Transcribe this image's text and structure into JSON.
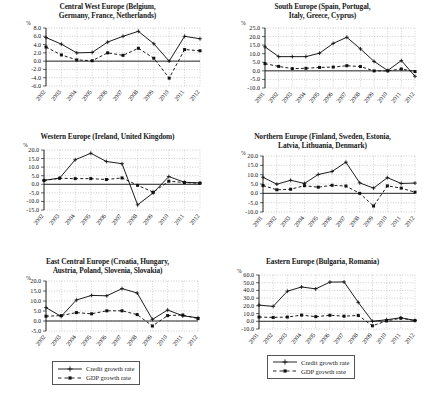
{
  "figure": {
    "units_label": "%",
    "legend": {
      "credit_label": "Credit growth rate",
      "gdp_label": "GDP growth rate",
      "credit_color": "#111111",
      "gdp_color": "#111111"
    }
  },
  "chart_data": [
    {
      "type": "line",
      "id": "central-west-europe",
      "title": "Central West Europe (Belgium, Germany, France, Netherlands)",
      "title_lines": [
        "Central West Europe (Belgium,",
        "Germany, France, Netherlands)"
      ],
      "xlabel": "",
      "ylabel": "%",
      "ylim": [
        -6.0,
        8.0
      ],
      "yticks": [
        8.0,
        6.0,
        4.0,
        2.0,
        0.0,
        -2.0,
        -4.0,
        -6.0
      ],
      "ytick_labels": [
        "8.0",
        "6.0",
        "4.0",
        "2.0",
        "0.0",
        "-2.0",
        "-4.0",
        "-6.0"
      ],
      "grid": true,
      "categories": [
        "2002",
        "2003",
        "2004",
        "2005",
        "2006",
        "2007",
        "2008",
        "2009",
        "2010",
        "2011",
        "2012"
      ],
      "series": [
        {
          "name": "Credit growth rate",
          "values": [
            5.7,
            4.1,
            2.0,
            2.1,
            4.6,
            6.0,
            7.2,
            4.2,
            0.0,
            6.0,
            5.4
          ]
        },
        {
          "name": "GDP growth rate",
          "values": [
            3.4,
            1.5,
            0.3,
            0.1,
            2.0,
            1.4,
            3.1,
            0.7,
            -4.1,
            2.8,
            2.5
          ]
        }
      ],
      "series_extra_last": [
        3.2,
        0.2
      ]
    },
    {
      "type": "line",
      "id": "south-europe",
      "title": "South Europe (Spain, Portugal, Italy, Greece, Cyprus)",
      "title_lines": [
        "South Europe (Spain, Portugal,",
        "Italy, Greece, Cyprus)"
      ],
      "xlabel": "",
      "ylabel": "%",
      "ylim": [
        -10.0,
        25.0
      ],
      "yticks": [
        25.0,
        20.0,
        15.0,
        10.0,
        5.0,
        0.0,
        -5.0,
        -10.0
      ],
      "ytick_labels": [
        "25.0",
        "20.0",
        "15.0",
        "10.0",
        "5.0",
        "0.0",
        "-5.0",
        "-10.0"
      ],
      "grid": true,
      "categories": [
        "2001",
        "2002",
        "2003",
        "2004",
        "2005",
        "2006",
        "2007",
        "2008",
        "2009",
        "2010",
        "2011",
        "2012"
      ],
      "series": [
        {
          "name": "Credit growth rate",
          "values": [
            14.0,
            8.3,
            8.3,
            8.3,
            10.3,
            16.0,
            19.6,
            12.8,
            5.5,
            0.2,
            6.0,
            -3.2
          ]
        },
        {
          "name": "GDP growth rate",
          "values": [
            4.2,
            2.6,
            1.3,
            1.5,
            2.0,
            2.2,
            3.0,
            2.5,
            0.0,
            0.0,
            1.1,
            -0.4
          ]
        }
      ]
    },
    {
      "type": "line",
      "id": "western-europe",
      "title": "Western Europe (Ireland, United Kingdom)",
      "title_lines": [
        "Western Europe (Ireland, United Kingdom)"
      ],
      "xlabel": "",
      "ylabel": "%",
      "ylim": [
        -15.0,
        20.0
      ],
      "yticks": [
        20.0,
        15.0,
        10.0,
        5.0,
        0.0,
        -5.0,
        -10.0,
        -15.0
      ],
      "ytick_labels": [
        "20.0",
        "15.0",
        "10.0",
        "5.0",
        "0.0",
        "-5.0",
        "-10.0",
        "-15.0"
      ],
      "grid": true,
      "categories": [
        "2002",
        "2003",
        "2004",
        "2005",
        "2006",
        "2007",
        "2008",
        "2009",
        "2010",
        "2011",
        "2012"
      ],
      "series": [
        {
          "name": "Credit growth rate",
          "values": [
            2.3,
            3.6,
            14.3,
            18.1,
            13.3,
            12.0,
            -12.0,
            -5.0,
            4.5,
            1.2,
            0.8
          ]
        },
        {
          "name": "GDP growth rate",
          "values": [
            2.2,
            3.5,
            3.3,
            3.3,
            2.8,
            3.7,
            -0.6,
            -4.6,
            1.8,
            1.0,
            0.6
          ]
        }
      ]
    },
    {
      "type": "line",
      "id": "northern-europe",
      "title": "Northern Europe (Finland, Sweden, Estonia, Latvia, Lithuania, Denmark)",
      "title_lines": [
        "Northern Europe (Finland, Sweden, Estonia,",
        "Latvia, Lithuania, Denmark)"
      ],
      "xlabel": "",
      "ylabel": "%",
      "ylim": [
        -10.0,
        20.0
      ],
      "yticks": [
        20.0,
        15.0,
        10.0,
        5.0,
        0.0,
        -5.0,
        -10.0
      ],
      "ytick_labels": [
        "20.0",
        "15.0",
        "10.0",
        "5.0",
        "0.0",
        "-5.0",
        "-10.0"
      ],
      "grid": true,
      "categories": [
        "2001",
        "2002",
        "2003",
        "2004",
        "2005",
        "2006",
        "2007",
        "2008",
        "2009",
        "2010",
        "2011",
        "2012"
      ],
      "series": [
        {
          "name": "Credit growth rate",
          "values": [
            8.6,
            4.9,
            7.0,
            5.3,
            10.1,
            11.7,
            16.7,
            5.6,
            2.8,
            8.4,
            5.3,
            5.5
          ]
        },
        {
          "name": "GDP growth rate",
          "values": [
            4.2,
            1.9,
            2.2,
            4.1,
            3.3,
            4.3,
            3.9,
            0.0,
            -6.8,
            4.0,
            2.8,
            0.6
          ]
        }
      ]
    },
    {
      "type": "line",
      "id": "east-central-europe",
      "title": "East Central Europe (Croatia, Hungary, Austria, Poland, Slovenia, Slovakia)",
      "title_lines": [
        "East Central Europe (Croatia, Hungary,",
        "Austria, Poland, Slovenia, Slovakia)"
      ],
      "xlabel": "",
      "ylabel": "%",
      "ylim": [
        -5.0,
        20.0
      ],
      "yticks": [
        20.0,
        15.0,
        10.0,
        5.0,
        0.0,
        -5.0
      ],
      "ytick_labels": [
        "20.0",
        "15.0",
        "10.0",
        "5.0",
        "0.0",
        "-5.0"
      ],
      "grid": true,
      "categories": [
        "2002",
        "2003",
        "2004",
        "2005",
        "2006",
        "2007",
        "2008",
        "2009",
        "2010",
        "2011",
        "2012"
      ],
      "series": [
        {
          "name": "Credit growth rate",
          "values": [
            6.7,
            2.3,
            10.5,
            12.8,
            12.6,
            16.2,
            14.0,
            0.8,
            5.5,
            2.6,
            1.6
          ]
        },
        {
          "name": "GDP growth rate",
          "values": [
            2.4,
            2.7,
            4.2,
            3.6,
            5.1,
            5.1,
            3.2,
            -2.5,
            2.7,
            3.0,
            1.2
          ]
        }
      ]
    },
    {
      "type": "line",
      "id": "eastern-europe",
      "title": "Eastern Europe (Bulgaria, Romania)",
      "title_lines": [
        "Eastern Europe (Bulgaria, Romania)"
      ],
      "xlabel": "",
      "ylabel": "%",
      "ylim": [
        -10.0,
        60.0
      ],
      "yticks": [
        60.0,
        50.0,
        40.0,
        30.0,
        20.0,
        10.0,
        0.0,
        -10.0
      ],
      "ytick_labels": [
        "60.0",
        "50.0",
        "40.0",
        "30.0",
        "20.0",
        "10.0",
        "0.0",
        "-10.0"
      ],
      "grid": true,
      "categories": [
        "2001",
        "2002",
        "2003",
        "2004",
        "2005",
        "2006",
        "2007",
        "2008",
        "2009",
        "2010",
        "2011",
        "2012"
      ],
      "series": [
        {
          "name": "Credit growth rate",
          "values": [
            21.0,
            19.3,
            39.0,
            44.5,
            42.0,
            50.8,
            51.0,
            24.5,
            0.0,
            2.0,
            4.6,
            1.0
          ]
        },
        {
          "name": "GDP growth rate",
          "values": [
            5.5,
            5.0,
            5.5,
            8.0,
            6.0,
            7.8,
            6.6,
            7.6,
            -5.8,
            0.5,
            4.0,
            1.0
          ]
        }
      ]
    }
  ]
}
